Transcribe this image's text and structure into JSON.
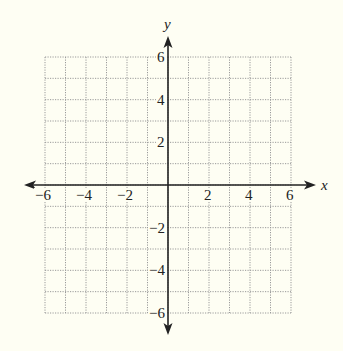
{
  "chart_data": {
    "type": "coordinate-grid",
    "title": "",
    "xlabel": "x",
    "ylabel": "y",
    "xlim": [
      -6,
      6
    ],
    "ylim": [
      -6,
      6
    ],
    "grid": true,
    "grid_step": 1,
    "x_ticks": [
      -6,
      -4,
      -2,
      2,
      4,
      6
    ],
    "y_ticks": [
      -6,
      -4,
      -2,
      2,
      4,
      6
    ],
    "x_tick_labels": [
      "−6",
      "−4",
      "−2",
      "2",
      "4",
      "6"
    ],
    "y_tick_labels": [
      "−6",
      "−4",
      "−2",
      "2",
      "4",
      "6"
    ]
  },
  "colors": {
    "background": "#fefef3",
    "axis": "#222222",
    "grid": "#9a9a9a"
  },
  "axes": {
    "x_label": "x",
    "y_label": "y"
  }
}
